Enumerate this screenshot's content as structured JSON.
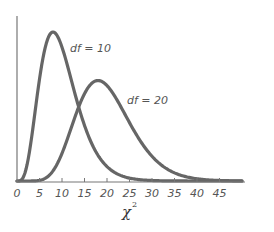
{
  "chart_data": {
    "type": "line",
    "title": "",
    "xlabel": "χ²",
    "ylabel": "",
    "xlim": [
      0,
      50
    ],
    "x_ticks": [
      0,
      5,
      10,
      15,
      20,
      25,
      30,
      35,
      40,
      45
    ],
    "x_tick_labels": [
      "0",
      "5",
      "10",
      "15",
      "20",
      "25",
      "30",
      "35",
      "40",
      "45"
    ],
    "grid": false,
    "legend": "none (inline curve labels)",
    "series": [
      {
        "name": "df = 10",
        "distribution": "chi-square",
        "df": 10,
        "peak_x": 8,
        "color": "#666666"
      },
      {
        "name": "df = 20",
        "distribution": "chi-square",
        "df": 20,
        "peak_x": 18,
        "color": "#666666"
      }
    ],
    "annotations": [
      {
        "text": "df = 10",
        "near_x": 10
      },
      {
        "text": "df = 20",
        "near_x": 22
      }
    ]
  },
  "labels": {
    "df10": "df = 10",
    "df20": "df = 20",
    "xlabel_main": "χ",
    "xlabel_sup": "2"
  },
  "colors": {
    "curve": "#666666",
    "axis": "#777777",
    "text": "#555555"
  }
}
